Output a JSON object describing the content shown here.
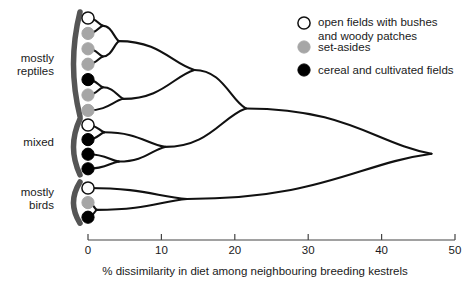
{
  "figure": {
    "type": "dendrogram",
    "background": "#ffffff",
    "line_color": "#111111",
    "bracket_color": "#555555"
  },
  "group_labels": [
    {
      "id": "reptiles",
      "text": "mostly\nreptiles"
    },
    {
      "id": "mixed",
      "text": "mixed"
    },
    {
      "id": "birds",
      "text": "mostly\nbirds"
    }
  ],
  "legend": {
    "position": "top-right",
    "items": [
      {
        "marker": "open-circle",
        "fill": "#ffffff",
        "stroke": "#111111",
        "label": "open fields with bushes\nand woody patches"
      },
      {
        "marker": "grey-circle",
        "fill": "#a6a6a6",
        "stroke": "#a6a6a6",
        "label": "set-asides"
      },
      {
        "marker": "black-circle",
        "fill": "#000000",
        "stroke": "#000000",
        "label": "cereal and cultivated fields"
      }
    ]
  },
  "axis": {
    "title": "% dissimilarity in diet among neighbouring breeding kestrels",
    "ticks": [
      0,
      10,
      20,
      30,
      40,
      50
    ],
    "tick_labels": [
      "0",
      "10",
      "20",
      "30",
      "40",
      "50"
    ],
    "range": [
      0,
      50
    ],
    "orientation": "horizontal",
    "grid": false
  },
  "chart_data": {
    "type": "dendrogram",
    "title": "",
    "xlabel": "% dissimilarity in diet among neighbouring breeding kestrels",
    "ylabel": "",
    "xlim": [
      0,
      50
    ],
    "categories": [
      "mostly reptiles",
      "mixed",
      "mostly birds"
    ],
    "leaves": [
      {
        "index": 0,
        "group": "mostly reptiles",
        "habitat": "open fields with bushes and woody patches",
        "marker": "open-circle"
      },
      {
        "index": 1,
        "group": "mostly reptiles",
        "habitat": "set-asides",
        "marker": "grey-circle"
      },
      {
        "index": 2,
        "group": "mostly reptiles",
        "habitat": "set-asides",
        "marker": "grey-circle"
      },
      {
        "index": 3,
        "group": "mostly reptiles",
        "habitat": "set-asides",
        "marker": "grey-circle"
      },
      {
        "index": 4,
        "group": "mostly reptiles",
        "habitat": "cereal and cultivated fields",
        "marker": "black-circle"
      },
      {
        "index": 5,
        "group": "mostly reptiles",
        "habitat": "set-asides",
        "marker": "grey-circle"
      },
      {
        "index": 6,
        "group": "mostly reptiles",
        "habitat": "set-asides",
        "marker": "grey-circle"
      },
      {
        "index": 7,
        "group": "mixed",
        "habitat": "open fields with bushes and woody patches",
        "marker": "open-circle"
      },
      {
        "index": 8,
        "group": "mixed",
        "habitat": "cereal and cultivated fields",
        "marker": "black-circle"
      },
      {
        "index": 9,
        "group": "mixed",
        "habitat": "cereal and cultivated fields",
        "marker": "black-circle"
      },
      {
        "index": 10,
        "group": "mixed",
        "habitat": "cereal and cultivated fields",
        "marker": "black-circle"
      },
      {
        "index": 11,
        "group": "mostly birds",
        "habitat": "open fields with bushes and woody patches",
        "marker": "open-circle"
      },
      {
        "index": 12,
        "group": "mostly birds",
        "habitat": "set-asides",
        "marker": "grey-circle"
      },
      {
        "index": 13,
        "group": "mostly birds",
        "habitat": "cereal and cultivated fields",
        "marker": "black-circle"
      }
    ],
    "merges": [
      {
        "id": "m0",
        "children": [
          0,
          1
        ],
        "height": 2.0
      },
      {
        "id": "m1",
        "children": [
          2,
          3
        ],
        "height": 2.0
      },
      {
        "id": "m2",
        "children": [
          "m0",
          "m1"
        ],
        "height": 4.2
      },
      {
        "id": "m3",
        "children": [
          4,
          5
        ],
        "height": 2.0
      },
      {
        "id": "m4",
        "children": [
          "m3",
          6
        ],
        "height": 4.8
      },
      {
        "id": "m5",
        "children": [
          "m2",
          "m4"
        ],
        "height": 14.5
      },
      {
        "id": "m6",
        "children": [
          7,
          8
        ],
        "height": 2.2
      },
      {
        "id": "m7",
        "children": [
          9,
          10
        ],
        "height": 4.2
      },
      {
        "id": "m8",
        "children": [
          "m6",
          "m7"
        ],
        "height": 10.5
      },
      {
        "id": "m9",
        "children": [
          "m5",
          "m8"
        ],
        "height": 21.5
      },
      {
        "id": "m10",
        "children": [
          12,
          13
        ],
        "height": 1.2
      },
      {
        "id": "m11",
        "children": [
          11,
          "m10"
        ],
        "height": 13.5
      },
      {
        "id": "m12",
        "children": [
          "m9",
          "m11"
        ],
        "height": 46.8
      }
    ],
    "group_brackets": [
      {
        "label": "mostly reptiles",
        "leaf_range": [
          0,
          6
        ]
      },
      {
        "label": "mixed",
        "leaf_range": [
          7,
          10
        ]
      },
      {
        "label": "mostly birds",
        "leaf_range": [
          11,
          13
        ]
      }
    ]
  }
}
